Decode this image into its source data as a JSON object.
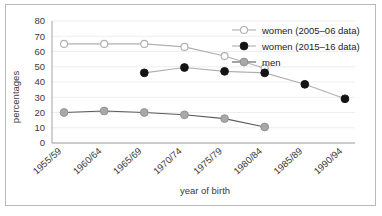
{
  "chart_data": {
    "type": "line",
    "title": "",
    "xlabel": "year of birth",
    "ylabel": "percentages",
    "categories": [
      "1955/59",
      "1960/64",
      "1965/69",
      "1970/74",
      "1975/79",
      "1980/84",
      "1985/89",
      "1990/94"
    ],
    "ylim": [
      0,
      80
    ],
    "yticks": [
      0,
      10,
      20,
      30,
      40,
      50,
      60,
      70,
      80
    ],
    "grid": "horizontal",
    "legend_position": "top-right",
    "series": [
      {
        "name": "women (2005–06 data)",
        "marker": "open-circle",
        "color": "#b0b0b0",
        "marker_fill": "#ffffff",
        "values": [
          65,
          65,
          65,
          63,
          57,
          49,
          null,
          null
        ]
      },
      {
        "name": "women (2015–16 data)",
        "marker": "filled-circle",
        "color": "#b0b0b0",
        "marker_fill": "#141414",
        "values": [
          null,
          null,
          46,
          49.5,
          47,
          46,
          38.5,
          29
        ]
      },
      {
        "name": "men",
        "marker": "filled-circle",
        "color": "#5a5a5a",
        "marker_fill": "#a8a8a8",
        "values": [
          20,
          21,
          20,
          18.5,
          16,
          10.5,
          null,
          null
        ]
      }
    ]
  },
  "legend": {
    "items": [
      {
        "label": "women (2005–06 data)"
      },
      {
        "label": "women (2015–16 data)"
      },
      {
        "label": "men"
      }
    ]
  },
  "axes": {
    "y_tick_labels": [
      "80",
      "70",
      "60",
      "50",
      "40",
      "30",
      "20",
      "10",
      "0"
    ],
    "x_tick_labels": [
      "1955/59",
      "1960/64",
      "1965/69",
      "1970/74",
      "1975/79",
      "1980/84",
      "1985/89",
      "1990/94"
    ],
    "y_title": "percentages",
    "x_title": "year of birth"
  }
}
